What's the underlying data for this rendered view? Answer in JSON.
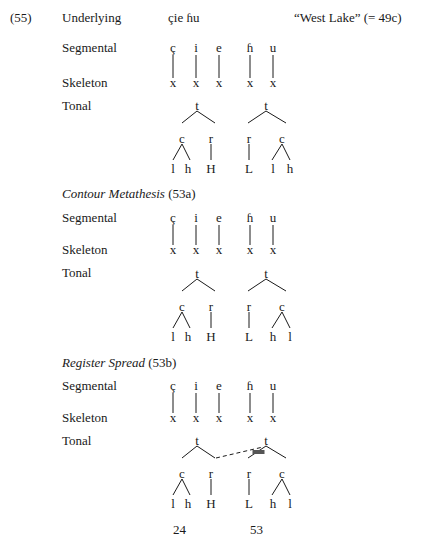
{
  "example_number": "(55)",
  "gloss": "“West Lake”  (= 49c)",
  "underlying": {
    "label": "Underlying",
    "form": "çie ɦu"
  },
  "tier_labels": {
    "segmental": "Segmental",
    "skeleton": "Skeleton",
    "tonal": "Tonal"
  },
  "segments": [
    "ç",
    "i",
    "e",
    "ɦ",
    "u"
  ],
  "skeleton_slot": "x",
  "sections": [
    {
      "heading": "",
      "heading_rule": "",
      "trees": [
        {
          "root": "t",
          "left": "c",
          "right": "r",
          "left_children": [
            "l",
            "h"
          ],
          "right_child": "H"
        },
        {
          "root": "t",
          "left": "r",
          "right": "c",
          "left_child": "L",
          "right_children": [
            "l",
            "h"
          ]
        }
      ]
    },
    {
      "heading": "Contour Metathesis",
      "heading_rule": "(53a)",
      "trees": [
        {
          "root": "t",
          "left": "c",
          "right": "r",
          "left_children": [
            "l",
            "h"
          ],
          "right_child": "H"
        },
        {
          "root": "t",
          "left": "r",
          "right": "c",
          "left_child": "L",
          "right_children": [
            "h",
            "l"
          ]
        }
      ]
    },
    {
      "heading": "Register Spread",
      "heading_rule": "(53b)",
      "trees": [
        {
          "root": "t",
          "left": "c",
          "right": "r",
          "left_children": [
            "l",
            "h"
          ],
          "right_child": "H"
        },
        {
          "root": "t",
          "left": "r",
          "right": "c",
          "left_child": "L",
          "right_children": [
            "h",
            "l"
          ]
        }
      ],
      "spread_link": "dashed",
      "delinked": "second tree t→r branch"
    }
  ],
  "tone_values": [
    "24",
    "53"
  ]
}
